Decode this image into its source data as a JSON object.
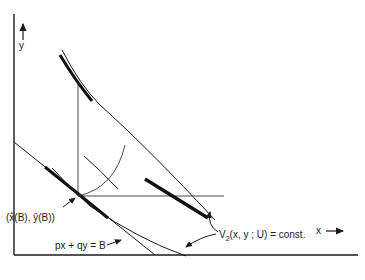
{
  "diagram": {
    "axes": {
      "y_label": "y",
      "x_label": "x"
    },
    "labels": {
      "tangency_point": "(x̂(B), ŷ(B))",
      "budget_line": "px + qy = B",
      "indifference_curve_prefix": "V",
      "indifference_curve_subscript": "2",
      "indifference_curve_suffix": "(x, y ; U) = const."
    },
    "colors": {
      "ink": "#1a1a1a",
      "background": "#ffffff"
    }
  }
}
